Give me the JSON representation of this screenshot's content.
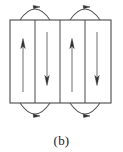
{
  "figure": {
    "caption": "(b)",
    "colors": {
      "stroke": "#4a4a4a",
      "arrow": "#333333",
      "arc": "#555555",
      "background": "#ffffff",
      "caption_text": "#1a1a1a"
    },
    "frame": {
      "left": 10,
      "top": 20,
      "right": 111,
      "bottom": 103,
      "width": 101,
      "height": 83,
      "stroke_width": 1.1
    },
    "dividers": [
      {
        "name": "divider-1",
        "x": 35
      },
      {
        "name": "divider-2",
        "x": 60
      },
      {
        "name": "divider-3",
        "x": 85
      }
    ],
    "domains": [
      {
        "name": "domain-1",
        "arrow_x": 23,
        "direction": "up",
        "label": "up",
        "tail_y": 92,
        "head_y": 40
      },
      {
        "name": "domain-2",
        "arrow_x": 47,
        "direction": "down",
        "label": "down",
        "tail_y": 32,
        "head_y": 84
      },
      {
        "name": "domain-3",
        "arrow_x": 72,
        "direction": "up",
        "label": "up",
        "tail_y": 92,
        "head_y": 40
      },
      {
        "name": "domain-4",
        "arrow_x": 97,
        "direction": "down",
        "label": "down",
        "tail_y": 32,
        "head_y": 84
      }
    ],
    "closure_arcs": [
      {
        "name": "top-arc-left",
        "position": "top",
        "start_x": 20,
        "end_x": 50,
        "apex_x": 35,
        "apex_y": 5,
        "arrow_direction": "right"
      },
      {
        "name": "top-arc-right",
        "position": "top",
        "start_x": 70,
        "end_x": 100,
        "apex_x": 85,
        "apex_y": 5,
        "arrow_direction": "right"
      },
      {
        "name": "bottom-arc-left",
        "position": "bottom",
        "start_x": 20,
        "end_x": 50,
        "apex_x": 35,
        "apex_y": 118,
        "arrow_direction": "right"
      },
      {
        "name": "bottom-arc-right",
        "position": "bottom",
        "start_x": 70,
        "end_x": 100,
        "apex_x": 85,
        "apex_y": 118,
        "arrow_direction": "right"
      }
    ]
  }
}
